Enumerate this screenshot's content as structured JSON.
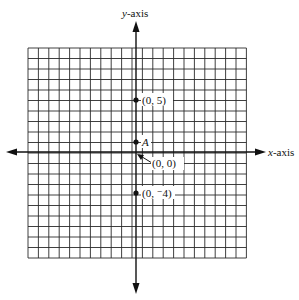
{
  "diagram": {
    "type": "coordinate-plane",
    "axes": {
      "x_label_prefix": "x",
      "x_label_suffix": "-axis",
      "y_label_prefix": "y",
      "y_label_suffix": "-axis"
    },
    "grid": {
      "columns": 21,
      "rows": 20,
      "line_color": "#222222"
    },
    "points": [
      {
        "label": "(0, 5)",
        "x": 0,
        "y": 5
      },
      {
        "label": "A",
        "x": 0,
        "y": 1
      },
      {
        "label": "(0, ⁻4)",
        "x": 0,
        "y": -4
      }
    ],
    "origin_label": "(0, 0)"
  }
}
